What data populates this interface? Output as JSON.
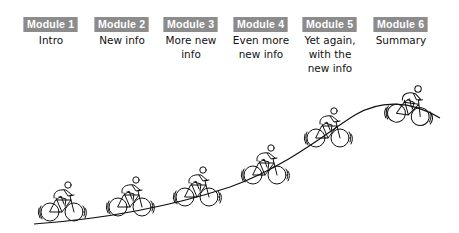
{
  "diagram": {
    "type": "learning-curve-hill",
    "modules": [
      {
        "badge": "Module 1",
        "description": "Intro"
      },
      {
        "badge": "Module 2",
        "description": "New info"
      },
      {
        "badge": "Module 3",
        "description": "More new info"
      },
      {
        "badge": "Module 4",
        "description": "Even more new info"
      },
      {
        "badge": "Module 5",
        "description": "Yet again, with the new info"
      },
      {
        "badge": "Module 6",
        "description": "Summary"
      }
    ],
    "colors": {
      "badge_bg": "#8c8c8c",
      "badge_text": "#ffffff",
      "line": "#111111"
    }
  }
}
